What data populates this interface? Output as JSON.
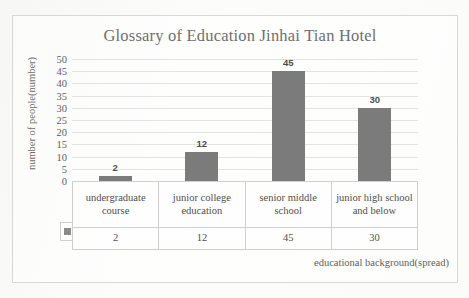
{
  "chart_data": {
    "type": "bar",
    "title": "Glossary of Education Jinhai Tian Hotel",
    "xlabel": "educational background(spread)",
    "ylabel": "number of people(number)",
    "categories": [
      "undergraduate course",
      "junior college education",
      "senior middle school",
      "junior high school and below"
    ],
    "values": [
      2,
      12,
      45,
      30
    ],
    "data_labels": [
      "2",
      "12",
      "45",
      "30"
    ],
    "ylim": [
      0,
      50
    ],
    "ytick_step": 5,
    "yticks": [
      "50",
      "45",
      "40",
      "35",
      "30",
      "25",
      "20",
      "15",
      "10",
      "5",
      "0"
    ],
    "grid": true,
    "legend_position": "data-table-left",
    "legend_marker": "gray-square",
    "series": [
      {
        "name": "number of people",
        "values": [
          2,
          12,
          45,
          30
        ],
        "color": "#7b7b7b"
      }
    ],
    "data_table": {
      "visible": true,
      "header_row": [
        "undergraduate course",
        "junior college education",
        "senior middle school",
        "junior high school and below"
      ],
      "value_row": [
        "2",
        "12",
        "45",
        "30"
      ]
    }
  },
  "colors": {
    "bar": "#7b7b7b",
    "gridline": "#e3e3e1",
    "title_text": "#6f6f6f",
    "axis_text": "#5e5e5e",
    "table_border": "#cfcfcd",
    "page_background": "#fdfdfc"
  }
}
